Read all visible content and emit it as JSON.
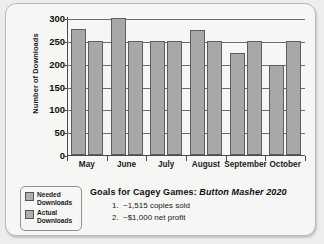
{
  "card": {
    "background_color": "#f6f6f5",
    "border_color": "#b9b9b9"
  },
  "legend": {
    "items": [
      {
        "label_line1": "Needed",
        "label_line2": "Downloads",
        "swatch_color": "#b0b0b0"
      },
      {
        "label_line1": "Actual",
        "label_line2": "Downloads",
        "swatch_color": "#b0b0b0"
      }
    ]
  },
  "goals": {
    "title_prefix": "Goals for Cagey Games:",
    "title_game": "Button Masher 2020",
    "items": [
      {
        "number": "1.",
        "text": "~1,515 copies sold"
      },
      {
        "number": "2.",
        "text": "~$1,000 net profit"
      }
    ]
  },
  "chart_data": {
    "type": "bar",
    "title": "Goals for Cagey Games: Button Masher 2020",
    "xlabel": "",
    "ylabel": "Number of Downloads",
    "categories": [
      "May",
      "June",
      "July",
      "August",
      "September",
      "October"
    ],
    "series": [
      {
        "name": "Needed Downloads",
        "values": [
          275,
          300,
          250,
          273,
          223,
          198
        ],
        "color": "#a8a8a8"
      },
      {
        "name": "Actual Downloads",
        "values": [
          250,
          250,
          250,
          250,
          250,
          250
        ],
        "color": "#a8a8a8"
      }
    ],
    "ylim": [
      0,
      300
    ],
    "yticks": [
      0,
      50,
      100,
      150,
      200,
      250,
      300
    ],
    "ytick_labels": [
      "0",
      "50",
      "100",
      "150",
      "200",
      "250",
      "300"
    ],
    "grid": true,
    "legend_position": "bottom-left"
  }
}
